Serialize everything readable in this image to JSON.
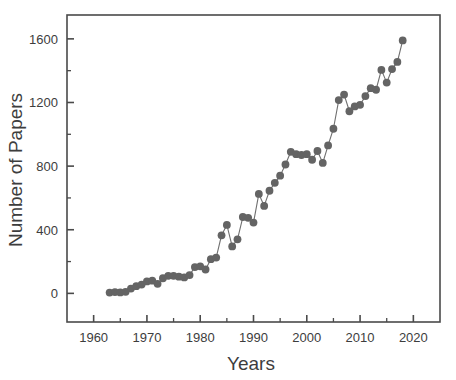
{
  "chart_data": {
    "type": "scatter",
    "title": "",
    "xlabel": "Years",
    "ylabel": "Number of Papers",
    "xlim": [
      1955,
      2025
    ],
    "ylim": [
      -180,
      1750
    ],
    "grid": false,
    "legend": null,
    "marker_color": "#646464",
    "line_color": "#6f6f6f",
    "axis_color": "#4a4a4a",
    "x_ticks_major": [
      1960,
      1970,
      1980,
      1990,
      2000,
      2010,
      2020
    ],
    "x_ticks_minor": [
      1965,
      1975,
      1985,
      1995,
      2005,
      2015
    ],
    "y_ticks_major": [
      0,
      400,
      800,
      1200,
      1600
    ],
    "y_ticks_minor": [
      200,
      600,
      1000,
      1400
    ],
    "x_tick_labels": [
      "1960",
      "1970",
      "1980",
      "1990",
      "2000",
      "2010",
      "2020"
    ],
    "y_tick_labels": [
      "0",
      "400",
      "800",
      "1200",
      "1600"
    ],
    "x": [
      1963,
      1964,
      1965,
      1966,
      1967,
      1968,
      1969,
      1970,
      1971,
      1972,
      1973,
      1974,
      1975,
      1976,
      1977,
      1978,
      1979,
      1980,
      1981,
      1982,
      1983,
      1984,
      1985,
      1986,
      1987,
      1988,
      1989,
      1990,
      1991,
      1992,
      1993,
      1994,
      1995,
      1996,
      1997,
      1998,
      1999,
      2000,
      2001,
      2002,
      2003,
      2004,
      2005,
      2006,
      2007,
      2008,
      2009,
      2010,
      2011,
      2012,
      2013,
      2014,
      2015,
      2016,
      2017
    ],
    "y": [
      5,
      8,
      6,
      10,
      30,
      45,
      55,
      75,
      80,
      60,
      95,
      110,
      110,
      105,
      100,
      115,
      165,
      170,
      150,
      215,
      225,
      365,
      430,
      295,
      340,
      480,
      475,
      445,
      625,
      550,
      645,
      695,
      740,
      810,
      890,
      875,
      870,
      875,
      840,
      895,
      820,
      930,
      1035,
      1215,
      1250,
      1145,
      1175,
      1185,
      1240,
      1290,
      1280,
      1405,
      1325,
      1410,
      1455,
      1590
    ],
    "series": [
      {
        "name": "Number of Papers",
        "points": [
          {
            "year": 1963,
            "value": 5
          },
          {
            "year": 1964,
            "value": 8
          },
          {
            "year": 1965,
            "value": 6
          },
          {
            "year": 1966,
            "value": 10
          },
          {
            "year": 1967,
            "value": 30
          },
          {
            "year": 1968,
            "value": 45
          },
          {
            "year": 1969,
            "value": 55
          },
          {
            "year": 1970,
            "value": 75
          },
          {
            "year": 1971,
            "value": 80
          },
          {
            "year": 1972,
            "value": 60
          },
          {
            "year": 1973,
            "value": 95
          },
          {
            "year": 1974,
            "value": 110
          },
          {
            "year": 1975,
            "value": 110
          },
          {
            "year": 1976,
            "value": 105
          },
          {
            "year": 1977,
            "value": 100
          },
          {
            "year": 1978,
            "value": 115
          },
          {
            "year": 1979,
            "value": 165
          },
          {
            "year": 1980,
            "value": 170
          },
          {
            "year": 1981,
            "value": 150
          },
          {
            "year": 1982,
            "value": 215
          },
          {
            "year": 1983,
            "value": 225
          },
          {
            "year": 1984,
            "value": 365
          },
          {
            "year": 1985,
            "value": 430
          },
          {
            "year": 1986,
            "value": 295
          },
          {
            "year": 1987,
            "value": 340
          },
          {
            "year": 1988,
            "value": 480
          },
          {
            "year": 1989,
            "value": 475
          },
          {
            "year": 1990,
            "value": 445
          },
          {
            "year": 1991,
            "value": 625
          },
          {
            "year": 1992,
            "value": 550
          },
          {
            "year": 1993,
            "value": 645
          },
          {
            "year": 1994,
            "value": 695
          },
          {
            "year": 1995,
            "value": 740
          },
          {
            "year": 1996,
            "value": 810
          },
          {
            "year": 1997,
            "value": 890
          },
          {
            "year": 1998,
            "value": 875
          },
          {
            "year": 1999,
            "value": 870
          },
          {
            "year": 2000,
            "value": 875
          },
          {
            "year": 2001,
            "value": 840
          },
          {
            "year": 2002,
            "value": 895
          },
          {
            "year": 2003,
            "value": 820
          },
          {
            "year": 2004,
            "value": 930
          },
          {
            "year": 2005,
            "value": 1035
          },
          {
            "year": 2006,
            "value": 1215
          },
          {
            "year": 2007,
            "value": 1250
          },
          {
            "year": 2008,
            "value": 1145
          },
          {
            "year": 2009,
            "value": 1175
          },
          {
            "year": 2010,
            "value": 1185
          },
          {
            "year": 2011,
            "value": 1240
          },
          {
            "year": 2012,
            "value": 1290
          },
          {
            "year": 2013,
            "value": 1280
          },
          {
            "year": 2014,
            "value": 1405
          },
          {
            "year": 2015,
            "value": 1325
          },
          {
            "year": 2016,
            "value": 1410
          },
          {
            "year": 2017,
            "value": 1455
          },
          {
            "year": 2018,
            "value": 1590
          }
        ]
      }
    ]
  }
}
